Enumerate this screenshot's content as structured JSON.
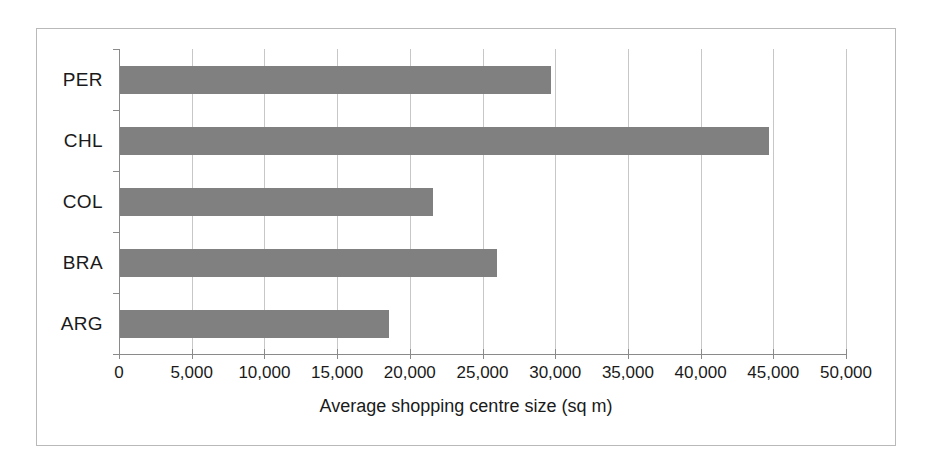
{
  "chart_data": {
    "type": "bar",
    "orientation": "horizontal",
    "title": "",
    "xlabel": "Average shopping centre size (sq m)",
    "ylabel": "",
    "categories": [
      "PER",
      "CHL",
      "COL",
      "BRA",
      "ARG"
    ],
    "values": [
      29700,
      44700,
      21600,
      26000,
      18600
    ],
    "xlim": [
      0,
      50000
    ],
    "xticks": [
      0,
      5000,
      10000,
      15000,
      20000,
      25000,
      30000,
      35000,
      40000,
      45000,
      50000
    ],
    "xtick_labels": [
      "0",
      "5,000",
      "10,000",
      "15,000",
      "20,000",
      "25,000",
      "30,000",
      "35,000",
      "40,000",
      "45,000",
      "50,000"
    ],
    "grid": true,
    "grid_axis": "x",
    "legend": false,
    "bar_color": "#808080",
    "gridline_color": "#c7c7c7",
    "axis_color": "#8a8a8a",
    "frame_color": "#b9b9b9",
    "background": "#ffffff",
    "series": [
      {
        "name": "Average shopping centre size (sq m)",
        "points": [
          {
            "category": "PER",
            "value": 29700
          },
          {
            "category": "CHL",
            "value": 44700
          },
          {
            "category": "COL",
            "value": 21600
          },
          {
            "category": "BRA",
            "value": 26000
          },
          {
            "category": "ARG",
            "value": 18600
          }
        ]
      }
    ]
  }
}
